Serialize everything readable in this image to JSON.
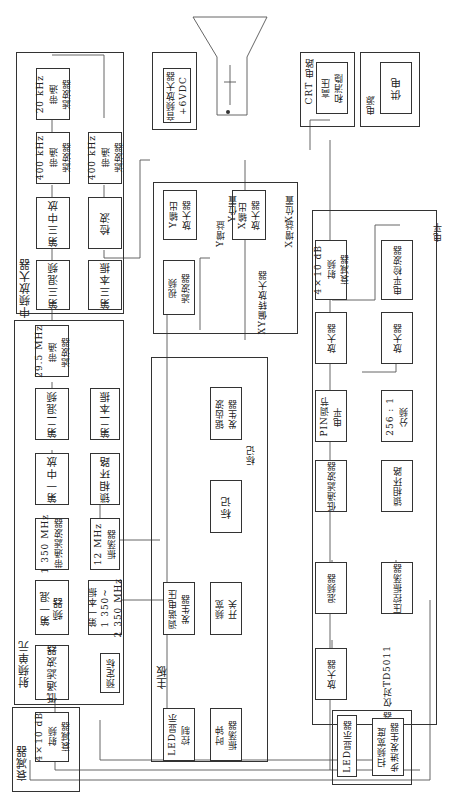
{
  "sections": {
    "attenuator": {
      "title": "衰减器",
      "blocks": {
        "rf_atten": "4×10 dB\n射频\n衰减器"
      }
    },
    "rf_unit": {
      "title": "射频单元",
      "blocks": {
        "lowpass": "低通滤波器",
        "mixer1": "第一混\n频器",
        "bpf_1350": "1 350 MHz\n带通滤波器",
        "if1": "第一中放",
        "mixer2": "第二混频",
        "bpf_295": "29.5 MHz\n带通\n滤波器",
        "lo1": "第一本振\n1 350~\n2 350 MHz",
        "preset": "预定标",
        "osc12": "12 MHz\n振荡器",
        "pll": "锁相环路",
        "lo2": "第二本振"
      }
    },
    "if_amp": {
      "title": "中频放大器",
      "blocks": {
        "mixer3": "第三混频",
        "if3": "第三中放",
        "bpf400a": "400 kHz\n带通\n滤波器",
        "bpf20": "20 kHz\n带通\n滤波器",
        "lo3": "第三本振",
        "detector": "检波",
        "bpf400b": "400 kHz\n带通\n滤波器"
      }
    },
    "xy_amp": {
      "title": "XY偏转放大器",
      "blocks": {
        "video_filter": "视频\n滤波器",
        "y_out": "Y输出\n放大器",
        "x_out": "X输出\n放大器"
      },
      "controls": {
        "y_gain": "Y增益",
        "y_pos": "Y位置",
        "x_gain": "X增益",
        "x_pos": "X位置"
      }
    },
    "audio": {
      "blocks": {
        "audio_amp": "音频放大器\n+6VDC"
      }
    },
    "crt": {
      "title": "CRT 电路",
      "blocks": {
        "hv": "高压\n和消隐"
      }
    },
    "power": {
      "title": "电源",
      "blocks": {
        "supply": "供电"
      }
    },
    "mainboard": {
      "title": "主板",
      "blocks": {
        "sawtooth": "锯齿波\n发生器",
        "marker": "标记",
        "tuning": "调谐电压\n发生器",
        "span": "频宽\n开关",
        "led_ctrl": "LED显示\n控制",
        "clock": "时钟\n振荡器"
      },
      "controls": {
        "marker_pot": "标记"
      }
    },
    "tracking": {
      "title": "跟踪发生器\n仅对TD5011",
      "blocks": {
        "rf_atten2": "4×10 dB\n射频\n衰减器",
        "amp_a": "放大器",
        "pin": "PIN调节\n电平",
        "lowpass2": "低通滤波器",
        "mixer": "混频器",
        "amp_in": "放大器",
        "level_det": "电平检波器",
        "amp_b": "放大器",
        "div256": "256 : 1\n分频",
        "pll2": "锁相环路",
        "vco": "压控振荡器"
      },
      "controls": {
        "level": "电平"
      }
    },
    "display_panel": {
      "blocks": {
        "led_disp": "LED显示器",
        "sweep": "扫频宽度\n步进发生器"
      }
    }
  }
}
